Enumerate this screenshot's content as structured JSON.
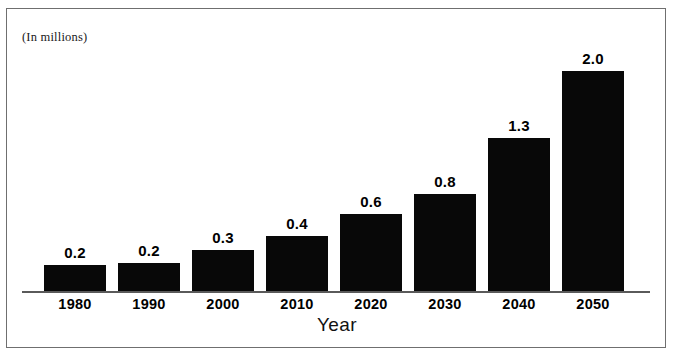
{
  "figure": {
    "units_note": "(In millions)",
    "x_axis_title": "Year",
    "frame_color": "#6f6f6f",
    "bar_color": "#080808",
    "axis_color": "#5a5a5a",
    "background": "#ffffff"
  },
  "chart_data": {
    "type": "bar",
    "title": "",
    "subtitle": "",
    "xlabel": "Year",
    "ylabel": "(In millions)",
    "categories": [
      "1980",
      "1990",
      "2000",
      "2010",
      "2020",
      "2030",
      "2040",
      "2050"
    ],
    "values": [
      0.2,
      0.2,
      0.3,
      0.4,
      0.6,
      0.8,
      1.3,
      2.0
    ],
    "data_labels": [
      "0.2",
      "0.2",
      "0.3",
      "0.4",
      "0.6",
      "0.8",
      "1.3",
      "2.0"
    ],
    "ylim": [
      0,
      2.0
    ],
    "grid": false,
    "legend": null,
    "y_axis_visible": false,
    "annotations": [
      "(In millions)"
    ]
  },
  "layout": {
    "baseline_y": 291,
    "bar_width": 62,
    "bar_pitch": 74,
    "first_bar_left": 44,
    "bar_tops": [
      265,
      263,
      250,
      236,
      214,
      194,
      138,
      71
    ]
  }
}
